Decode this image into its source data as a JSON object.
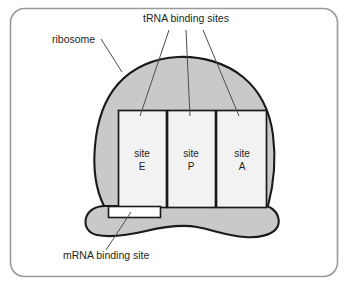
{
  "figure": {
    "frame": {
      "border_color": "#9a9a9a",
      "background": "#ffffff",
      "corner_radius": 14
    },
    "colors": {
      "ribosome_fill": "#c9c9c9",
      "ribosome_outline": "#1a1a1a",
      "site_fill": "#f2f2f2",
      "site_outline": "#1a1a1a",
      "mrna_site_fill": "#ffffff",
      "leader_line": "#4d4d4d",
      "text": "#231f20"
    },
    "annotations": [
      {
        "id": "trna-binding-sites",
        "label": "tRNA binding sites",
        "x": 186,
        "y": 22,
        "anchor": "middle",
        "leaders": 3
      },
      {
        "id": "ribosome",
        "label": "ribosome",
        "x": 52,
        "y": 43,
        "anchor": "start",
        "leaders": 1
      },
      {
        "id": "mrna-binding-site",
        "label": "mRNA binding site",
        "x": 63,
        "y": 259,
        "anchor": "start",
        "leaders": 1
      }
    ],
    "sites": [
      {
        "id": "site-e",
        "line1": "site",
        "line2": "E",
        "x": 142,
        "y": 157
      },
      {
        "id": "site-p",
        "line1": "site",
        "line2": "P",
        "x": 191,
        "y": 157
      },
      {
        "id": "site-a",
        "line1": "site",
        "line2": "A",
        "x": 242,
        "y": 157
      }
    ],
    "parts": {
      "large_subunit": "large ribosomal subunit (dome)",
      "small_subunit": "small ribosomal subunit (lobe)",
      "mrna_channel": "mRNA binding site channel"
    }
  }
}
